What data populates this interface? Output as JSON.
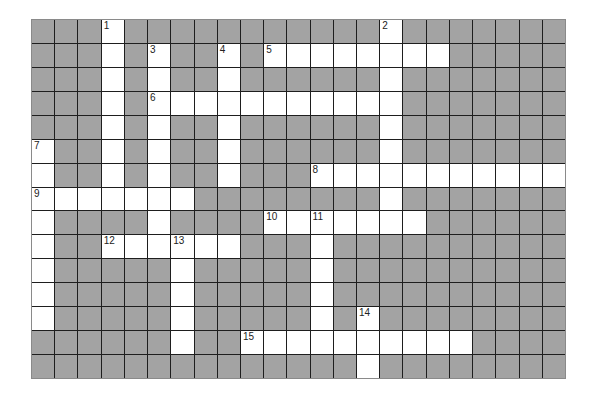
{
  "puzzle": {
    "rows": 15,
    "cols": 23,
    "colors": {
      "block": "#a3a3a3",
      "open": "#ffffff",
      "grid_line": "#1e1e1e"
    },
    "open_cells": [
      [
        0,
        3
      ],
      [
        0,
        15
      ],
      [
        1,
        3
      ],
      [
        1,
        5
      ],
      [
        1,
        8
      ],
      [
        1,
        10
      ],
      [
        1,
        11
      ],
      [
        1,
        12
      ],
      [
        1,
        13
      ],
      [
        1,
        14
      ],
      [
        1,
        15
      ],
      [
        1,
        16
      ],
      [
        1,
        17
      ],
      [
        2,
        3
      ],
      [
        2,
        5
      ],
      [
        2,
        8
      ],
      [
        2,
        15
      ],
      [
        3,
        3
      ],
      [
        3,
        5
      ],
      [
        3,
        6
      ],
      [
        3,
        7
      ],
      [
        3,
        8
      ],
      [
        3,
        9
      ],
      [
        3,
        10
      ],
      [
        3,
        11
      ],
      [
        3,
        12
      ],
      [
        3,
        13
      ],
      [
        3,
        14
      ],
      [
        3,
        15
      ],
      [
        4,
        3
      ],
      [
        4,
        5
      ],
      [
        4,
        8
      ],
      [
        4,
        15
      ],
      [
        5,
        0
      ],
      [
        5,
        3
      ],
      [
        5,
        5
      ],
      [
        5,
        8
      ],
      [
        5,
        15
      ],
      [
        6,
        0
      ],
      [
        6,
        3
      ],
      [
        6,
        5
      ],
      [
        6,
        8
      ],
      [
        6,
        12
      ],
      [
        6,
        13
      ],
      [
        6,
        14
      ],
      [
        6,
        15
      ],
      [
        6,
        16
      ],
      [
        6,
        17
      ],
      [
        6,
        18
      ],
      [
        6,
        19
      ],
      [
        6,
        20
      ],
      [
        6,
        21
      ],
      [
        6,
        22
      ],
      [
        7,
        0
      ],
      [
        7,
        1
      ],
      [
        7,
        2
      ],
      [
        7,
        3
      ],
      [
        7,
        4
      ],
      [
        7,
        5
      ],
      [
        7,
        6
      ],
      [
        7,
        15
      ],
      [
        8,
        0
      ],
      [
        8,
        5
      ],
      [
        8,
        10
      ],
      [
        8,
        11
      ],
      [
        8,
        12
      ],
      [
        8,
        13
      ],
      [
        8,
        14
      ],
      [
        8,
        15
      ],
      [
        8,
        16
      ],
      [
        9,
        0
      ],
      [
        9,
        3
      ],
      [
        9,
        4
      ],
      [
        9,
        5
      ],
      [
        9,
        6
      ],
      [
        9,
        7
      ],
      [
        9,
        8
      ],
      [
        9,
        12
      ],
      [
        10,
        0
      ],
      [
        10,
        6
      ],
      [
        10,
        12
      ],
      [
        11,
        0
      ],
      [
        11,
        6
      ],
      [
        11,
        12
      ],
      [
        12,
        0
      ],
      [
        12,
        6
      ],
      [
        12,
        12
      ],
      [
        12,
        14
      ],
      [
        13,
        6
      ],
      [
        13,
        9
      ],
      [
        13,
        10
      ],
      [
        13,
        11
      ],
      [
        13,
        12
      ],
      [
        13,
        13
      ],
      [
        13,
        14
      ],
      [
        13,
        15
      ],
      [
        13,
        16
      ],
      [
        13,
        17
      ],
      [
        13,
        18
      ],
      [
        14,
        14
      ]
    ],
    "numbers": [
      {
        "n": "1",
        "r": 0,
        "c": 3
      },
      {
        "n": "2",
        "r": 0,
        "c": 15
      },
      {
        "n": "3",
        "r": 1,
        "c": 5
      },
      {
        "n": "4",
        "r": 1,
        "c": 8
      },
      {
        "n": "5",
        "r": 1,
        "c": 10
      },
      {
        "n": "6",
        "r": 3,
        "c": 5
      },
      {
        "n": "7",
        "r": 5,
        "c": 0
      },
      {
        "n": "8",
        "r": 6,
        "c": 12
      },
      {
        "n": "9",
        "r": 7,
        "c": 0
      },
      {
        "n": "10",
        "r": 8,
        "c": 10
      },
      {
        "n": "11",
        "r": 8,
        "c": 12
      },
      {
        "n": "12",
        "r": 9,
        "c": 3
      },
      {
        "n": "13",
        "r": 9,
        "c": 6
      },
      {
        "n": "14",
        "r": 12,
        "c": 14
      },
      {
        "n": "15",
        "r": 13,
        "c": 9
      }
    ]
  }
}
